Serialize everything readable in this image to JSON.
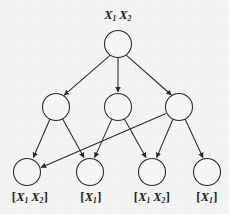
{
  "figure": {
    "type": "directed-acyclic-graph",
    "background_color": "#f4f4f2",
    "stroke_color": "#2a2a2a",
    "node_fill": "#f6f6f4",
    "levels": 3,
    "root_label": {
      "base1": "X",
      "sub1": "1",
      "base2": "X",
      "sub2": "2"
    }
  },
  "nodes": {
    "root": {
      "id": "n0",
      "cx": 118,
      "cy": 44,
      "r": 13.5,
      "label_above": "X1 X2"
    },
    "middle": [
      {
        "id": "m1",
        "cx": 56,
        "cy": 107,
        "r": 13.5
      },
      {
        "id": "m2",
        "cx": 118,
        "cy": 107,
        "r": 13.5
      },
      {
        "id": "m3",
        "cx": 179,
        "cy": 107,
        "r": 13.5
      }
    ],
    "leaves": [
      {
        "id": "l1",
        "cx": 27,
        "cy": 172,
        "r": 13.5,
        "label": "[X1 X2]"
      },
      {
        "id": "l2",
        "cx": 90,
        "cy": 172,
        "r": 13.5,
        "label": "[X1]"
      },
      {
        "id": "l3",
        "cx": 152,
        "cy": 172,
        "r": 13.5,
        "label": "[X1 X2]"
      },
      {
        "id": "l4",
        "cx": 207,
        "cy": 172,
        "r": 13.5,
        "label": "[X1]"
      }
    ]
  },
  "edges": [
    {
      "from": "n0",
      "to": "m1",
      "arrow": true
    },
    {
      "from": "n0",
      "to": "m2",
      "arrow": true
    },
    {
      "from": "n0",
      "to": "m3",
      "arrow": true
    },
    {
      "from": "m1",
      "to": "l1",
      "arrow": true
    },
    {
      "from": "m1",
      "to": "l2",
      "arrow": true
    },
    {
      "from": "m2",
      "to": "l2",
      "arrow": true
    },
    {
      "from": "m2",
      "to": "l3",
      "arrow": true
    },
    {
      "from": "m3",
      "to": "l3",
      "arrow": true
    },
    {
      "from": "m3",
      "to": "l4",
      "arrow": true
    },
    {
      "from": "m3",
      "to": "l1",
      "arrow": true
    }
  ],
  "labels": {
    "root": {
      "x": 118,
      "y": 10,
      "base1": "X",
      "sub1": "1",
      "base2": "X",
      "sub2": "2"
    },
    "leaf_1": {
      "x": 30,
      "y": 191,
      "open": "[",
      "base1": "X",
      "sub1": "1",
      "base2": "X",
      "sub2": "2",
      "close": "]"
    },
    "leaf_2": {
      "x": 91,
      "y": 191,
      "open": "[",
      "base1": "X",
      "sub1": "1",
      "close": "]"
    },
    "leaf_3": {
      "x": 152,
      "y": 191,
      "open": "[",
      "base1": "X",
      "sub1": "1",
      "base2": "X",
      "sub2": "2",
      "close": "]"
    },
    "leaf_4": {
      "x": 207,
      "y": 191,
      "open": "[",
      "base1": "X",
      "sub1": "1",
      "close": "]"
    }
  }
}
